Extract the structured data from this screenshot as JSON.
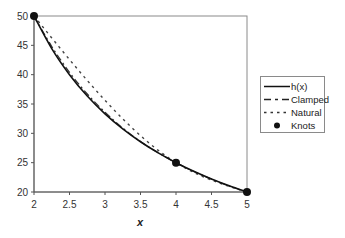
{
  "chart_data": {
    "type": "line",
    "title": "",
    "xlabel": "x",
    "ylabel": "",
    "xlim": [
      2,
      5
    ],
    "ylim": [
      20,
      50
    ],
    "x_ticks": [
      "2",
      "2.5",
      "3",
      "3.5",
      "4",
      "4.5",
      "5"
    ],
    "y_ticks": [
      "20",
      "25",
      "30",
      "35",
      "40",
      "45",
      "50"
    ],
    "grid": false,
    "legend_position": "right",
    "series": [
      {
        "name": "h(x)",
        "style": "solid",
        "x": [
          2,
          2.25,
          2.5,
          2.75,
          3,
          3.25,
          3.5,
          3.75,
          4,
          4.25,
          4.5,
          4.75,
          5
        ],
        "values": [
          50,
          44.44,
          40,
          36.36,
          33.33,
          30.77,
          28.57,
          26.67,
          25,
          23.53,
          22.22,
          21.05,
          20
        ]
      },
      {
        "name": "Clamped",
        "style": "dashed",
        "x": [
          2,
          2.25,
          2.5,
          2.75,
          3,
          3.25,
          3.5,
          3.75,
          4,
          4.25,
          4.5,
          4.75,
          5
        ],
        "values": [
          50,
          44.8,
          40.4,
          36.7,
          33.6,
          30.9,
          28.6,
          26.7,
          25,
          23.5,
          22.2,
          21.0,
          20
        ]
      },
      {
        "name": "Natural",
        "style": "dotted",
        "x": [
          2,
          2.25,
          2.5,
          2.75,
          3,
          3.25,
          3.5,
          3.75,
          4,
          4.25,
          4.5,
          4.75,
          5
        ],
        "values": [
          50,
          46.8,
          43.6,
          40.6,
          37.6,
          34.8,
          32.2,
          29.8,
          25,
          23.6,
          22.3,
          21.1,
          20
        ]
      },
      {
        "name": "Knots",
        "style": "marker",
        "x": [
          2,
          4,
          5
        ],
        "values": [
          50,
          25,
          20
        ]
      }
    ]
  },
  "legend": {
    "items": [
      {
        "label": "h(x)"
      },
      {
        "label": "Clamped"
      },
      {
        "label": "Natural"
      },
      {
        "label": "Knots"
      }
    ]
  },
  "axes": {
    "x_label": "x"
  }
}
